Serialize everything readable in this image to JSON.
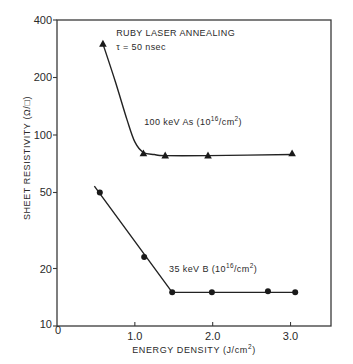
{
  "chart_data": {
    "type": "line",
    "title": "",
    "xlabel": "ENERGY DENSITY (J/cm²)",
    "xlabel_parts": {
      "main": "ENERGY DENSITY (J/cm",
      "sup": "2",
      "end": ")"
    },
    "ylabel": "SHEET RESISTIVITY (Ω/□)",
    "xscale": "linear",
    "yscale": "log",
    "xlim": [
      0,
      3.52
    ],
    "ylim": [
      10,
      400
    ],
    "x_ticks": [
      0,
      1.0,
      2.0,
      3.0
    ],
    "x_tick_labels": [
      "0",
      "1.0",
      "2.0",
      "3.0"
    ],
    "y_ticks": [
      10,
      20,
      50,
      100,
      200,
      400
    ],
    "y_tick_labels": [
      "10",
      "20",
      "50",
      "100",
      "200",
      "400"
    ],
    "grid": false,
    "legend": null,
    "annotations": [
      {
        "text": "RUBY LASER ANNEALING",
        "x": 0.76,
        "y": 330
      },
      {
        "text": "τ = 50 nsec",
        "x": 0.76,
        "y": 280
      }
    ],
    "series": [
      {
        "name": "100 keV As (10¹⁶/cm²)",
        "label_parts": {
          "main": "100  keV As (10",
          "sup": "16",
          "end": "/cm",
          "sup2": "2",
          "end2": ")"
        },
        "label_pos": {
          "x": 1.12,
          "y": 113
        },
        "marker": "triangle",
        "x": [
          0.59,
          1.11,
          1.39,
          1.94,
          3.02
        ],
        "y": [
          300,
          80,
          78,
          78,
          80
        ],
        "curve": [
          [
            0.59,
            300
          ],
          [
            0.75,
            190
          ],
          [
            0.9,
            120
          ],
          [
            1.0,
            92
          ],
          [
            1.11,
            81
          ],
          [
            1.25,
            79
          ],
          [
            1.39,
            78
          ],
          [
            1.94,
            78
          ],
          [
            3.02,
            79
          ]
        ]
      },
      {
        "name": "35 keV B (10¹⁶/cm²)",
        "label_parts": {
          "main": "35  keV B (10",
          "sup": "16",
          "end": "/cm",
          "sup2": "2",
          "end2": ")"
        },
        "label_pos": {
          "x": 1.44,
          "y": 19.2
        },
        "marker": "circle",
        "x": [
          0.55,
          1.12,
          1.48,
          1.99,
          2.71,
          3.06
        ],
        "y": [
          50,
          23,
          15,
          15,
          15.2,
          15
        ],
        "curve": [
          [
            0.48,
            54
          ],
          [
            1.48,
            15
          ],
          [
            3.06,
            15
          ]
        ]
      }
    ]
  },
  "plot_box": {
    "left": 57,
    "top": 20,
    "right": 331,
    "bottom": 326
  }
}
